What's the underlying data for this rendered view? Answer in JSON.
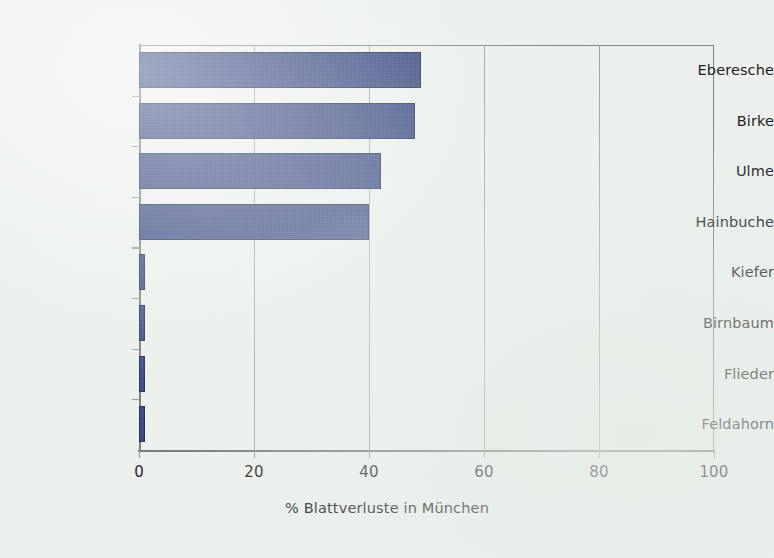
{
  "chart_data": {
    "type": "bar",
    "orientation": "horizontal",
    "title": "",
    "subtitle": "",
    "xlabel": "% Blattverluste in München",
    "ylabel": "",
    "categories": [
      "Eberesche",
      "Birke",
      "Ulme",
      "Hainbuche",
      "Kiefer",
      "Birnbaum",
      "Flieder",
      "Feldahorn"
    ],
    "values": [
      49,
      48,
      42,
      40,
      1,
      1,
      1,
      1
    ],
    "series": [
      {
        "name": "% Blattverluste in München",
        "values": [
          49,
          48,
          42,
          40,
          1,
          1,
          1,
          1
        ]
      }
    ],
    "xlim": [
      0,
      100
    ],
    "x_ticks": [
      0,
      20,
      40,
      60,
      80,
      100
    ],
    "x_tick_labels": [
      "0",
      "20",
      "40",
      "60",
      "80",
      "100"
    ],
    "gridlines": [
      20,
      40,
      60,
      80
    ],
    "grid": true,
    "legend": "none",
    "bar_color": "#2a3d7c",
    "bar_edge_color": "#18244d",
    "background_color": "#ebf0ec",
    "axis_color": "#6d7a71",
    "grid_color": "#9aa69d",
    "annotations": []
  },
  "axis": {
    "x_title": "% Blattverluste in München",
    "tick_0": "0",
    "tick_20": "20",
    "tick_40": "40",
    "tick_60": "60",
    "tick_80": "80",
    "tick_100": "100"
  },
  "categories": {
    "c0": "Eberesche",
    "c1": "Birke",
    "c2": "Ulme",
    "c3": "Hainbuche",
    "c4": "Kiefer",
    "c5": "Birnbaum",
    "c6": "Flieder",
    "c7": "Feldahorn"
  }
}
